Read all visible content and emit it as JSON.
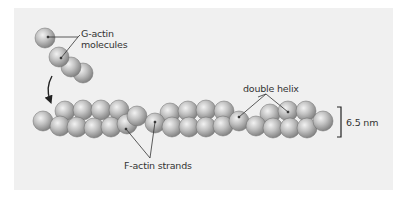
{
  "figure": {
    "labels": {
      "g_actin_line1": "G-actin",
      "g_actin_line2": "molecules",
      "double_helix": "double helix",
      "f_actin": "F-actin strands",
      "diameter": "6.5 nm"
    },
    "colors": {
      "panel_bg": "#f0f0f0",
      "sphere_light": "#e8e8e8",
      "sphere_mid": "#b4b4b4",
      "sphere_dark": "#7a7a7a",
      "leader_line": "#333333",
      "arrow": "#222222"
    }
  }
}
